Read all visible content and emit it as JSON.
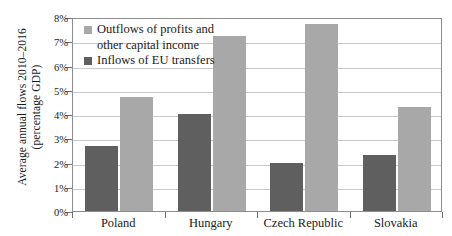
{
  "chart_data": {
    "type": "bar",
    "title": "",
    "xlabel": "",
    "ylabel": "Average annual flows 2010–2016 (percentage GDP)",
    "ylabel_line1": "Average annual flows 2010–2016",
    "ylabel_line2": "(percentage GDP)",
    "categories": [
      "Poland",
      "Hungary",
      "Czech Republic",
      "Slovakia"
    ],
    "series": [
      {
        "name": "Inflows of EU transfers",
        "color": "#5f5f5f",
        "values": [
          2.7,
          4.0,
          2.0,
          2.3
        ]
      },
      {
        "name": "Outflows of profits and other capital income",
        "color": "#a8a8a8",
        "values": [
          4.7,
          7.2,
          7.7,
          4.3
        ]
      }
    ],
    "ylim": [
      0,
      8
    ],
    "ytick_values": [
      0,
      1,
      2,
      3,
      4,
      5,
      6,
      7,
      8
    ],
    "ytick_labels": [
      "0%",
      "1%",
      "2%",
      "3%",
      "4%",
      "5%",
      "6%",
      "7%",
      "8%"
    ],
    "grid": true,
    "legend_position": "top-left"
  },
  "legend": {
    "outflow_line1": "Outflows of profits and",
    "outflow_line2": "other capital income",
    "inflow_line1": "Inflows of EU transfers"
  }
}
